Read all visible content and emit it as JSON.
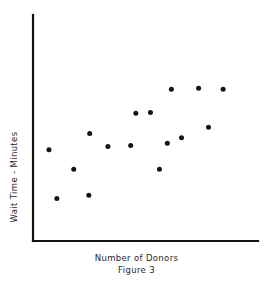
{
  "chart_data": {
    "type": "scatter",
    "title": "Figure 3",
    "xlabel": "Number of Donors",
    "ylabel": "Wait Time - Minutes",
    "grid": false,
    "legend": null,
    "axis_ticks": {
      "x": [],
      "y": []
    },
    "xlim": [
      0,
      100
    ],
    "ylim": [
      0,
      100
    ],
    "points": [
      {
        "x": 7.1,
        "y": 40.4
      },
      {
        "x": 10.6,
        "y": 18.8
      },
      {
        "x": 18.1,
        "y": 31.8
      },
      {
        "x": 24.8,
        "y": 20.2
      },
      {
        "x": 25.2,
        "y": 47.6
      },
      {
        "x": 33.3,
        "y": 41.8
      },
      {
        "x": 43.4,
        "y": 42.3
      },
      {
        "x": 45.7,
        "y": 56.5
      },
      {
        "x": 52.2,
        "y": 56.9
      },
      {
        "x": 56.2,
        "y": 31.8
      },
      {
        "x": 59.7,
        "y": 43.3
      },
      {
        "x": 61.5,
        "y": 67.1
      },
      {
        "x": 66.0,
        "y": 45.7
      },
      {
        "x": 73.6,
        "y": 67.6
      },
      {
        "x": 78.0,
        "y": 50.3
      },
      {
        "x": 84.5,
        "y": 67.1
      }
    ]
  },
  "style": {
    "axis_color": "#121212",
    "point_color": "#141414",
    "background": "#ffffff",
    "point_radius": 2.5
  },
  "axes_geometry": {
    "x_origin": 33,
    "y_origin": 241,
    "x_end": 258,
    "y_top": 15
  }
}
